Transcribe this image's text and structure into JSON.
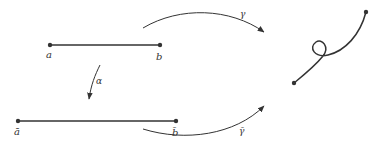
{
  "diagram": {
    "labels": {
      "a": "a",
      "b": "b",
      "a_bar": "ā",
      "b_bar": "b̄",
      "alpha": "α",
      "gamma": "γ",
      "gamma_bar": "γ̄"
    },
    "colors": {
      "stroke": "#333333"
    }
  }
}
